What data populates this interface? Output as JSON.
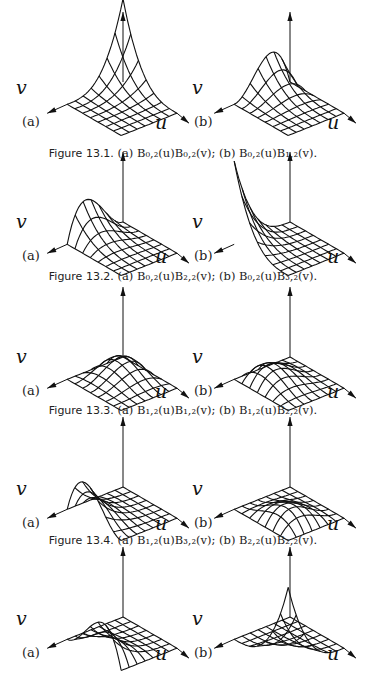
{
  "figures": [
    {
      "id": "13.1",
      "caption_label": "Figure 13.1.",
      "caption_text": "(a) B₀,₂(u)B₀,₂(v); (b) B₀,₂(u)B₁,₂(v).",
      "panels": [
        {
          "label": "(a)",
          "axis_u": "u",
          "axis_v": "v",
          "function": "B0,2(u)B0,2(v)",
          "i": 0,
          "j": 0
        },
        {
          "label": "(b)",
          "axis_u": "u",
          "axis_v": "v",
          "function": "B0,2(u)B1,2(v)",
          "i": 0,
          "j": 1
        }
      ]
    },
    {
      "id": "13.2",
      "caption_label": "Figure 13.2.",
      "caption_text": "(a) B₀,₂(u)B₂,₂(v); (b) B₀,₂(u)B₃,₂(v).",
      "panels": [
        {
          "label": "(a)",
          "axis_u": "u",
          "axis_v": "v",
          "function": "B0,2(u)B2,2(v)",
          "i": 0,
          "j": 2
        },
        {
          "label": "(b)",
          "axis_u": "u",
          "axis_v": "v",
          "function": "B0,2(u)B3,2(v)",
          "i": 0,
          "j": 3
        }
      ]
    },
    {
      "id": "13.3",
      "caption_label": "Figure 13.3.",
      "caption_text": "(a) B₁,₂(u)B₁,₂(v); (b) B₁,₂(u)B₂,₂(v).",
      "panels": [
        {
          "label": "(a)",
          "axis_u": "u",
          "axis_v": "v",
          "function": "B1,2(u)B1,2(v)",
          "i": 1,
          "j": 1
        },
        {
          "label": "(b)",
          "axis_u": "u",
          "axis_v": "v",
          "function": "B1,2(u)B2,2(v)",
          "i": 1,
          "j": 2
        }
      ]
    },
    {
      "id": "13.4",
      "caption_label": "Figure 13.4.",
      "caption_text": "(a) B₁,₂(u)B₃,₂(v); (b) B₂,₂(u)B₂,₂(v).",
      "panels": [
        {
          "label": "(a)",
          "axis_u": "u",
          "axis_v": "v",
          "function": "B1,2(u)B3,2(v)",
          "i": 1,
          "j": 3
        },
        {
          "label": "(b)",
          "axis_u": "u",
          "axis_v": "v",
          "function": "B2,2(u)B2,2(v)",
          "i": 2,
          "j": 2
        }
      ]
    },
    {
      "id": "13.5",
      "caption_label": "",
      "caption_text": "",
      "panels": [
        {
          "label": "(a)",
          "axis_u": "u",
          "axis_v": "v",
          "function": "B2,2(u)B3,2(v)",
          "i": 2,
          "j": 3
        },
        {
          "label": "(b)",
          "axis_u": "u",
          "axis_v": "v",
          "function": "B3,2(u)B3,2(v)",
          "i": 3,
          "j": 3
        }
      ]
    }
  ],
  "colors": {
    "ink": "#111111",
    "background": "#ffffff"
  }
}
